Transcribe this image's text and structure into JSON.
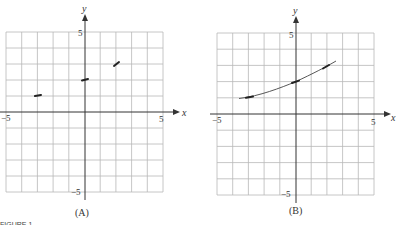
{
  "figure_label": "FIGURE 1",
  "graphs": [
    {
      "id": "A",
      "caption": "(A)",
      "x_axis_label": "x",
      "y_axis_label": "y",
      "x_ticks": {
        "min": "−5",
        "max": "5"
      },
      "y_ticks": {
        "max": "5",
        "min": "−5"
      },
      "segments": [
        {
          "x": -3,
          "y": 1
        },
        {
          "x": 0,
          "y": 2
        },
        {
          "x": 2,
          "y": 3
        }
      ]
    },
    {
      "id": "B",
      "caption": "(B)",
      "x_axis_label": "x",
      "y_axis_label": "y",
      "x_ticks": {
        "min": "−5",
        "max": "5"
      },
      "y_ticks": {
        "max": "5",
        "min": "−5"
      },
      "curve": "increasing exponential-like curve from x≈-3.5 to x≈2.6",
      "segments": [
        {
          "x": -3,
          "y": 1
        },
        {
          "x": 0,
          "y": 2
        },
        {
          "x": 2,
          "y": 3
        }
      ]
    }
  ]
}
